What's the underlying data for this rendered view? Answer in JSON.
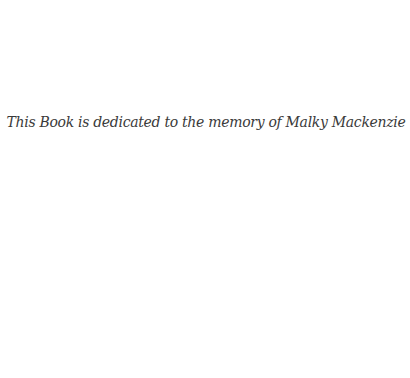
{
  "page": {
    "dedication": "This Book is dedicated to the memory of Malky Mackenzie",
    "text_color": "#3a3a3a",
    "background_color": "#ffffff"
  }
}
